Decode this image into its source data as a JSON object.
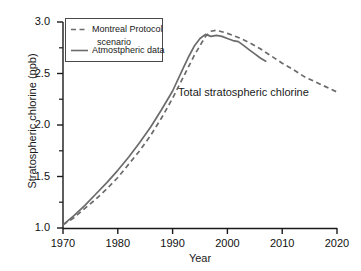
{
  "chart_data": {
    "type": "line",
    "title": "",
    "annotation": "Total stratospheric chlorine",
    "xlabel": "Year",
    "ylabel": "Stratospheric chlorine (ppb)",
    "xlim": [
      1970,
      2020
    ],
    "ylim": [
      1.0,
      3.0
    ],
    "xticks": [
      "1970",
      "1980",
      "1990",
      "2000",
      "2010",
      "2020"
    ],
    "yticks": [
      "1.0",
      "1.5",
      "2.0",
      "2.5",
      "3.0"
    ],
    "yticks_minor": [
      1.25,
      1.75,
      2.25,
      2.75
    ],
    "grid": false,
    "legend_position": "upper-left",
    "series": [
      {
        "name": "Montreal Protocol scenario",
        "style": "dashed",
        "color": "#6b6b6b",
        "x": [
          1970,
          1972,
          1974,
          1976,
          1978,
          1980,
          1982,
          1984,
          1986,
          1988,
          1990,
          1992,
          1994,
          1996,
          1997,
          1998,
          2000,
          2002,
          2004,
          2006,
          2008,
          2010,
          2012,
          2014,
          2016,
          2018,
          2020
        ],
        "values": [
          1.03,
          1.1,
          1.19,
          1.28,
          1.38,
          1.49,
          1.62,
          1.75,
          1.9,
          2.07,
          2.26,
          2.47,
          2.68,
          2.86,
          2.91,
          2.92,
          2.89,
          2.85,
          2.8,
          2.74,
          2.67,
          2.6,
          2.54,
          2.47,
          2.42,
          2.37,
          2.32
        ]
      },
      {
        "name": "Atmostpheric data",
        "style": "solid",
        "color": "#6b6b6b",
        "x": [
          1970,
          1972,
          1974,
          1976,
          1978,
          1980,
          1982,
          1984,
          1986,
          1988,
          1990,
          1992,
          1993,
          1994,
          1995,
          1996,
          1997,
          1998,
          1999,
          2000,
          2001,
          2002,
          2003,
          2004,
          2005,
          2006,
          2007
        ],
        "values": [
          1.03,
          1.12,
          1.22,
          1.33,
          1.44,
          1.56,
          1.69,
          1.83,
          1.98,
          2.15,
          2.33,
          2.56,
          2.67,
          2.77,
          2.84,
          2.88,
          2.86,
          2.87,
          2.86,
          2.84,
          2.82,
          2.81,
          2.77,
          2.73,
          2.69,
          2.65,
          2.62
        ]
      }
    ]
  },
  "legend": {
    "entries": [
      {
        "label_line1": "Montreal Protocol",
        "label_line2": "scenario",
        "style": "dashed"
      },
      {
        "label_line1": "Atmostpheric data",
        "label_line2": "",
        "style": "solid"
      }
    ]
  }
}
